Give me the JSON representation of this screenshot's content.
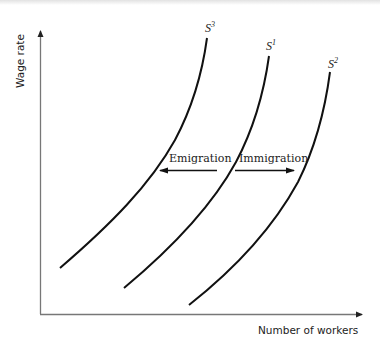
{
  "diagram": {
    "y_axis_label": "Wage rate",
    "x_axis_label": "Number of workers",
    "curves": [
      {
        "name": "S",
        "superscript": "3"
      },
      {
        "name": "S",
        "superscript": "1"
      },
      {
        "name": "S",
        "superscript": "2"
      }
    ],
    "arrows": {
      "left_label": "Emigration",
      "right_label": "Immigration"
    }
  },
  "colors": {
    "curve": "#111111",
    "axis": "#777777",
    "text": "#222222"
  }
}
